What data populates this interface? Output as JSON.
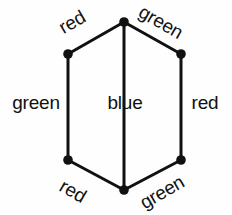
{
  "figure": {
    "type": "hexagon-graph-edge-coloring",
    "background_color": "#fefefe",
    "stroke_color": "#111111",
    "vertex_color": "#111111"
  },
  "graph": {
    "vertices": [
      {
        "id": "top",
        "name": "vertex-top",
        "x": 124,
        "y": 22
      },
      {
        "id": "upper-left",
        "name": "vertex-upper-left",
        "x": 68,
        "y": 54
      },
      {
        "id": "upper-right",
        "name": "vertex-upper-right",
        "x": 181,
        "y": 54
      },
      {
        "id": "lower-left",
        "name": "vertex-lower-left",
        "x": 68,
        "y": 160
      },
      {
        "id": "lower-right",
        "name": "vertex-lower-right",
        "x": 181,
        "y": 160
      },
      {
        "id": "bottom",
        "name": "vertex-bottom",
        "x": 124,
        "y": 190
      }
    ],
    "vertex_radius": 4.5,
    "edges": [
      {
        "id": "e-top-left",
        "from": "upper-left",
        "to": "top",
        "label": "red",
        "orientation": "diagonal-up"
      },
      {
        "id": "e-top-right",
        "from": "top",
        "to": "upper-right",
        "label": "green",
        "orientation": "diagonal-down"
      },
      {
        "id": "e-left",
        "from": "upper-left",
        "to": "lower-left",
        "label": "green",
        "orientation": "vertical"
      },
      {
        "id": "e-center",
        "from": "top",
        "to": "bottom",
        "label": "blue",
        "orientation": "vertical"
      },
      {
        "id": "e-right",
        "from": "upper-right",
        "to": "lower-right",
        "label": "red",
        "orientation": "vertical"
      },
      {
        "id": "e-bottom-left",
        "from": "lower-left",
        "to": "bottom",
        "label": "red",
        "orientation": "diagonal-down"
      },
      {
        "id": "e-bottom-right",
        "from": "bottom",
        "to": "lower-right",
        "label": "green",
        "orientation": "diagonal-up"
      }
    ]
  },
  "labels": {
    "top_left": "red",
    "top_right": "green",
    "left": "green",
    "center": "blue",
    "right": "red",
    "bottom_left": "red",
    "bottom_right": "green"
  }
}
